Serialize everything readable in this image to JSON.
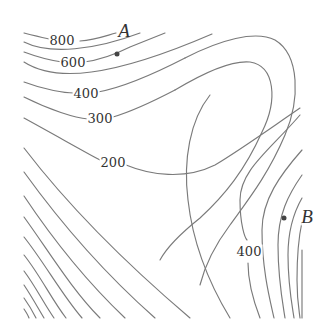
{
  "figure": {
    "type": "contour-map",
    "line_color": "#7a7a7a",
    "labels": [
      {
        "id": "c800",
        "text": "800",
        "x": 62,
        "y": 40
      },
      {
        "id": "c600",
        "text": "600",
        "x": 73,
        "y": 62
      },
      {
        "id": "c400a",
        "text": "400",
        "x": 86,
        "y": 93
      },
      {
        "id": "c300",
        "text": "300",
        "x": 100,
        "y": 118
      },
      {
        "id": "c200",
        "text": "200",
        "x": 113,
        "y": 162
      },
      {
        "id": "c400b",
        "text": "400",
        "x": 249,
        "y": 251
      }
    ],
    "points": [
      {
        "name": "A",
        "dot_x": 117,
        "dot_y": 54,
        "label_x": 124,
        "label_y": 30
      },
      {
        "name": "B",
        "dot_x": 284,
        "dot_y": 218,
        "label_x": 307,
        "label_y": 216
      }
    ]
  }
}
